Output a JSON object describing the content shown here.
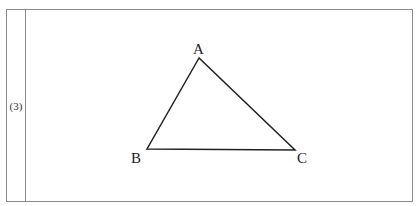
{
  "problem": {
    "number_label": "(3)"
  },
  "diagram": {
    "type": "triangle",
    "stroke_color": "#222222",
    "vertices": [
      {
        "name": "A",
        "x": 199,
        "y": 58,
        "label_x": 193,
        "label_y": 54
      },
      {
        "name": "B",
        "x": 147,
        "y": 149,
        "label_x": 131,
        "label_y": 163
      },
      {
        "name": "C",
        "x": 295,
        "y": 150,
        "label_x": 297,
        "label_y": 163
      }
    ]
  }
}
